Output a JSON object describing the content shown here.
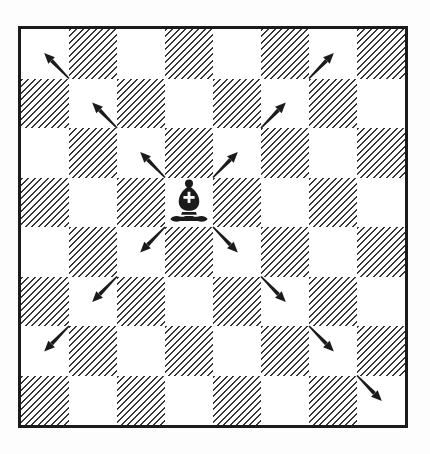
{
  "figure": {
    "type": "chess-diagram",
    "colors": {
      "ink": "#1b1b1b",
      "paper": "#ffffff"
    },
    "board": {
      "columns": 8,
      "rows": 8,
      "top_left_square": "light",
      "dark_square_style": "diagonal-hatch",
      "files": [
        "a",
        "b",
        "c",
        "d",
        "e",
        "f",
        "g",
        "h"
      ]
    },
    "piece": {
      "name": "black-bishop",
      "glyph": "♝",
      "square": "d5",
      "col": 3,
      "row": 3
    },
    "move_arrows": [
      {
        "square": "c6",
        "col": 2,
        "row": 2,
        "direction": "up-left"
      },
      {
        "square": "b7",
        "col": 1,
        "row": 1,
        "direction": "up-left"
      },
      {
        "square": "a8",
        "col": 0,
        "row": 0,
        "direction": "up-left"
      },
      {
        "square": "e6",
        "col": 4,
        "row": 2,
        "direction": "up-right"
      },
      {
        "square": "f7",
        "col": 5,
        "row": 1,
        "direction": "up-right"
      },
      {
        "square": "g8",
        "col": 6,
        "row": 0,
        "direction": "up-right"
      },
      {
        "square": "c4",
        "col": 2,
        "row": 4,
        "direction": "down-left"
      },
      {
        "square": "b3",
        "col": 1,
        "row": 5,
        "direction": "down-left"
      },
      {
        "square": "a2",
        "col": 0,
        "row": 6,
        "direction": "down-left"
      },
      {
        "square": "e4",
        "col": 4,
        "row": 4,
        "direction": "down-right"
      },
      {
        "square": "f3",
        "col": 5,
        "row": 5,
        "direction": "down-right"
      },
      {
        "square": "g2",
        "col": 6,
        "row": 6,
        "direction": "down-right"
      },
      {
        "square": "h1",
        "col": 7,
        "row": 7,
        "direction": "down-right"
      }
    ]
  }
}
